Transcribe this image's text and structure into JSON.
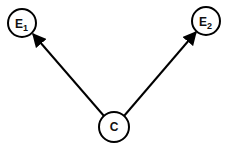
{
  "diagram": {
    "nodes": [
      {
        "id": "E1",
        "label": "E",
        "subscript": "1",
        "cx": 22,
        "cy": 23,
        "r": 14
      },
      {
        "id": "E2",
        "label": "E",
        "subscript": "2",
        "cx": 206,
        "cy": 21,
        "r": 14
      },
      {
        "id": "C",
        "label": "C",
        "subscript": "",
        "cx": 114,
        "cy": 127,
        "r": 15
      }
    ],
    "edges": [
      {
        "from": "C",
        "to": "E1"
      },
      {
        "from": "C",
        "to": "E2"
      }
    ],
    "stroke_color": "#000000"
  }
}
